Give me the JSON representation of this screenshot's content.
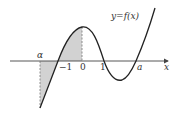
{
  "figure": {
    "function_label": "y=f(x)",
    "axis_label_x": "x",
    "tick_labels": {
      "alpha": "α",
      "neg_one": "−1",
      "zero": "0",
      "one": "1",
      "a": "a"
    },
    "shaded_regions": [
      {
        "from": "α",
        "to": "−1",
        "side": "below x-axis"
      },
      {
        "from": "−1",
        "to": "0",
        "side": "above x-axis"
      }
    ],
    "dashed_lines_at": [
      "α",
      "0"
    ],
    "colors": {
      "curve": "#222222",
      "axis": "#444444",
      "shade": "#cfcfcf",
      "dash": "#777777"
    }
  }
}
